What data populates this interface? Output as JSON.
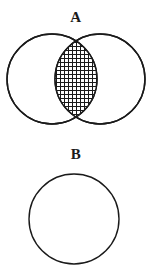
{
  "page": {
    "background_color": "#ffffff",
    "width": 152,
    "height": 276,
    "kind": "two-panel set-theory figure"
  },
  "figures": [
    {
      "label": "A",
      "type": "venn-two-circle-intersection",
      "description": "Two overlapping circles of equal size; the lens-shaped intersection region is filled with a cross-hatch grid pattern.",
      "stroke_color": "#1a1a1a",
      "stroke_width": 1.4,
      "fill_color": "#ffffff",
      "hatch": {
        "style": "cross-hatch",
        "spacing": 4,
        "line_width": 1,
        "line_color": "#1a1a1a"
      },
      "circles": [
        {
          "name": "left-circle",
          "cx": 52,
          "cy": 53,
          "r": 45
        },
        {
          "name": "right-circle",
          "cx": 100,
          "cy": 53,
          "r": 45
        }
      ],
      "intersection": {
        "name": "lens-region",
        "shaded": true,
        "left": 55,
        "right": 97,
        "top": 10,
        "bottom": 96
      }
    },
    {
      "label": "B",
      "type": "single-circle",
      "description": "A single unshaded circle.",
      "stroke_color": "#1a1a1a",
      "stroke_width": 1.4,
      "fill_color": "#ffffff",
      "circles": [
        {
          "name": "solo-circle",
          "cx": 74,
          "cy": 53,
          "r": 45
        }
      ]
    }
  ],
  "labels": {
    "figure_a": "A",
    "figure_b": "B"
  }
}
